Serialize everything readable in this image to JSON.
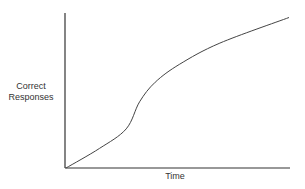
{
  "chart_data": {
    "type": "line",
    "title": "",
    "xlabel": "Time",
    "ylabel": "Correct Responses",
    "ylabel_lines": [
      "Correct",
      "Responses"
    ],
    "grid": false,
    "legend": null,
    "x_ticks": [],
    "y_ticks": [],
    "series": [
      {
        "name": "learning curve",
        "description": "S-shaped (sigmoid) growth curve: slow initial rise, steep middle, decelerating toward an asymptote",
        "x": [
          0,
          0.15,
          0.27,
          0.33,
          0.4,
          0.51,
          0.69,
          1.0
        ],
        "y": [
          0,
          0.13,
          0.26,
          0.44,
          0.57,
          0.69,
          0.83,
          1.0
        ]
      }
    ],
    "xlim": [
      0,
      1
    ],
    "ylim": [
      0,
      1.03
    ]
  }
}
